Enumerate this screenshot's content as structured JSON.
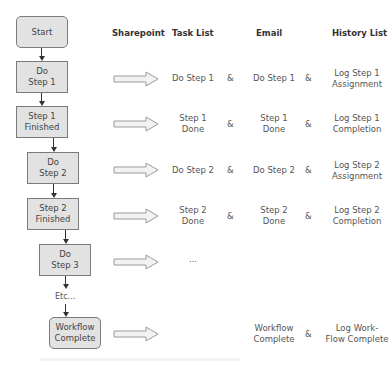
{
  "headers": {
    "sharepoint": "Sharepoint",
    "task_list": "Task List",
    "email": "Email",
    "history_list": "History List"
  },
  "flow": {
    "start": "Start",
    "do_step_1": "Do\nStep 1",
    "step_1_finished": "Step 1\nFinished",
    "do_step_2": "Do\nStep 2",
    "step_2_finished": "Step 2\nFinished",
    "do_step_3": "Do\nStep 3",
    "etc": "Etc...",
    "workflow_complete": "Workflow\nComplete"
  },
  "rows": [
    {
      "task": "Do Step 1",
      "amp1": "&",
      "email": "Do Step 1",
      "amp2": "&",
      "history": "Log Step 1\nAssignment"
    },
    {
      "task": "Step 1\nDone",
      "amp1": "&",
      "email": "Step 1\nDone",
      "amp2": "&",
      "history": "Log Step 1\nCompletion"
    },
    {
      "task": "Do Step 2",
      "amp1": "&",
      "email": "Do Step 2",
      "amp2": "&",
      "history": "Log Step 2\nAssignment"
    },
    {
      "task": "Step 2\nDone",
      "amp1": "&",
      "email": "Step 2\nDone",
      "amp2": "&",
      "history": "Log Step 2\nCompletion"
    },
    {
      "task": "...",
      "amp1": "",
      "email": "",
      "amp2": "",
      "history": ""
    },
    {
      "task": "",
      "amp1": "",
      "email": "Workflow\nComplete",
      "amp2": "&",
      "history": "Log Work-\nFlow Complete"
    }
  ],
  "colors": {
    "box_fill": "#e2e2e2",
    "box_border": "#7a7a7a",
    "arrow_fill": "#f2f2f2",
    "arrow_border": "#9a9a9a",
    "connector": "#333333"
  }
}
